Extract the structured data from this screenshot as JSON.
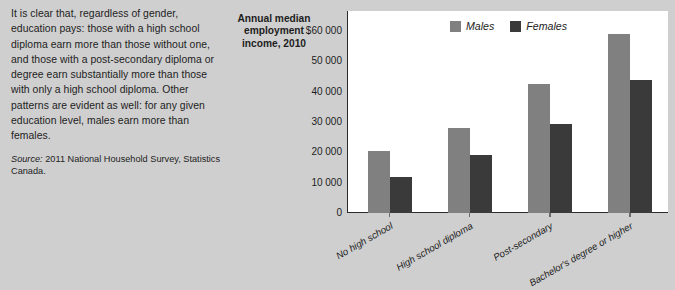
{
  "colors": {
    "page_background": "#cfcfcf",
    "plot_background": "#ffffff",
    "axis": "#2b2b2b",
    "text": "#1d1d1d",
    "males": "#808080",
    "females": "#3a3a3a"
  },
  "article": {
    "body": "It is clear that, regardless of gender, education pays: those with a high school diploma earn more than those without one, and those with a post-secondary diploma or degree earn substantially more than those with only a high school diploma. Other patterns are evident as well: for any given education level, males earn more than females.",
    "source_label": "Source:",
    "source_text": "2011 National Household Survey, Statistics Canada."
  },
  "chart_data": {
    "type": "bar",
    "title": "Annual median employment income, 2010",
    "xlabel": "",
    "ylabel": "",
    "ylim": [
      0,
      60000
    ],
    "grid": false,
    "legend_position": "top-center",
    "ytick_labels": [
      "$60 000",
      "50 000",
      "40 000",
      "30 000",
      "20 000",
      "10 000",
      "0"
    ],
    "ytick_values": [
      60000,
      50000,
      40000,
      30000,
      20000,
      10000,
      0
    ],
    "categories": [
      "No high school",
      "High school diploma",
      "Post-secondary",
      "Bachelor's degree or higher"
    ],
    "series": [
      {
        "name": "Males",
        "color": "#808080",
        "values": [
          20500,
          28000,
          42500,
          59000
        ]
      },
      {
        "name": "Females",
        "color": "#3a3a3a",
        "values": [
          12000,
          19000,
          29500,
          43800
        ]
      }
    ]
  }
}
